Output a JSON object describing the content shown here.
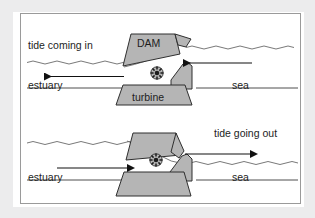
{
  "figure": {
    "type": "diagram",
    "panels": [
      {
        "id": "upper-panel",
        "name": "flood-tide-panel",
        "caption": "tide coming in",
        "left_label": "estuary",
        "right_label": "sea",
        "dam_label": "DAM",
        "turbine_label": "turbine",
        "flow_direction": "sea-to-estuary",
        "arrows": [
          {
            "name": "sea-inflow-arrow",
            "direction": "left",
            "side": "sea"
          },
          {
            "name": "estuary-outflow-arrow",
            "direction": "left",
            "side": "estuary"
          }
        ]
      },
      {
        "id": "lower-panel",
        "name": "ebb-tide-panel",
        "caption": "tide going out",
        "left_label": "estuary",
        "right_label": "sea",
        "flow_direction": "estuary-to-sea",
        "arrows": [
          {
            "name": "estuary-inflow-arrow",
            "direction": "right",
            "side": "estuary"
          },
          {
            "name": "sea-outflow-arrow",
            "direction": "right",
            "side": "sea"
          }
        ]
      }
    ],
    "colors": {
      "dam_fill": "#b3b3b3",
      "dam_stroke": "#3a3a3a",
      "water_line": "#5a5a5a",
      "arrow": "#111111",
      "frame_border": "#9a9a9a",
      "page_margin": "#ececed",
      "text": "#1d1d1d"
    },
    "icons": {
      "turbine_wheel": "turbine-wheel-icon"
    }
  }
}
